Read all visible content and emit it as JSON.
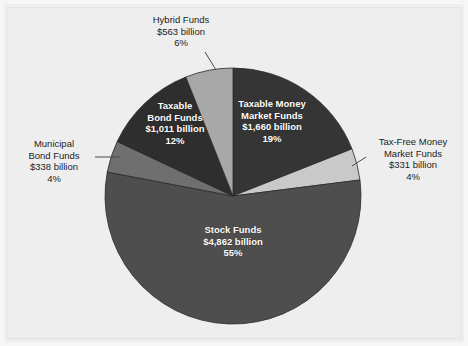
{
  "chart_data": {
    "type": "pie",
    "title": "",
    "subtitle": "",
    "xlabel": "",
    "ylabel": "",
    "legend_position": "none",
    "grid": false,
    "units": "billions of U.S. dollars",
    "total_value": 8765,
    "total_percent": 100,
    "categories": [
      "Taxable Money Market Funds",
      "Tax-Free Money Market Funds",
      "Stock Funds",
      "Municipal Bond Funds",
      "Taxable Bond Funds",
      "Hybrid Funds"
    ],
    "values": [
      1660,
      331,
      4862,
      338,
      1011,
      563
    ],
    "percents": [
      19,
      4,
      55,
      4,
      12,
      6
    ],
    "slices": [
      {
        "key": "taxable-money-market-funds",
        "name": "Taxable Money",
        "name_line2": "Market Funds",
        "value_label": "$1,660 billion",
        "percent_label": "19%",
        "value": 1660,
        "percent": 19,
        "color": "#353535",
        "label_placement": "inside",
        "start_deg": 0,
        "end_deg": 68.4
      },
      {
        "key": "tax-free-money-market-funds",
        "name": "Tax-Free Money",
        "name_line2": "Market Funds",
        "value_label": "$331 billion",
        "percent_label": "4%",
        "value": 331,
        "percent": 4,
        "color": "#c9c9c9",
        "label_placement": "outside-right",
        "start_deg": 68.4,
        "end_deg": 82.8
      },
      {
        "key": "stock-funds",
        "name": "Stock Funds",
        "name_line2": "",
        "value_label": "$4,862 billion",
        "percent_label": "55%",
        "value": 4862,
        "percent": 55,
        "color": "#4e4e4e",
        "label_placement": "inside",
        "start_deg": 82.8,
        "end_deg": 280.8
      },
      {
        "key": "municipal-bond-funds",
        "name": "Municipal",
        "name_line2": "Bond Funds",
        "value_label": "$338 billion",
        "percent_label": "4%",
        "value": 338,
        "percent": 4,
        "color": "#6f6f6f",
        "label_placement": "outside-left",
        "start_deg": 280.8,
        "end_deg": 295.2
      },
      {
        "key": "taxable-bond-funds",
        "name": "Taxable",
        "name_line2": "Bond Funds",
        "value_label": "$1,011 billion",
        "percent_label": "12%",
        "value": 1011,
        "percent": 12,
        "color": "#2e2e2e",
        "label_placement": "inside",
        "start_deg": 295.2,
        "end_deg": 338.4
      },
      {
        "key": "hybrid-funds",
        "name": "Hybrid Funds",
        "name_line2": "",
        "value_label": "$563 billion",
        "percent_label": "6%",
        "value": 563,
        "percent": 6,
        "color": "#a8a8a8",
        "label_placement": "outside-top",
        "start_deg": 338.4,
        "end_deg": 360
      }
    ],
    "geometry": {
      "center_x": 233,
      "center_y": 196,
      "radius": 128
    },
    "colors": {
      "background": "#eeeeee",
      "slice_outline": "#2a2a2a",
      "inside_label_text": "#ffffff",
      "outside_label_text": "#1d1d1d",
      "leader_line": "#4a4a4a"
    }
  }
}
